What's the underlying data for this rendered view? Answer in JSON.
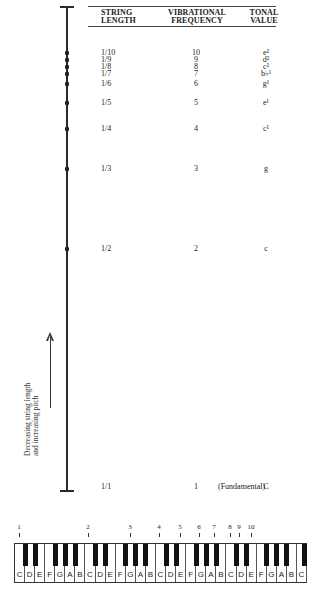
{
  "headers": {
    "string_length": [
      "STRING",
      "LENGTH"
    ],
    "vibrational_frequency": [
      "VIBRATIONAL",
      "FREQUENCY"
    ],
    "tonal_value": [
      "TONAL",
      "VALUE"
    ]
  },
  "rows": [
    {
      "length": "1/10",
      "frequency": "10",
      "tone": "e²",
      "y": 53
    },
    {
      "length": "1/9",
      "frequency": "9",
      "tone": "d²",
      "y": 60
    },
    {
      "length": "1/8",
      "frequency": "8",
      "tone": "c²",
      "y": 67
    },
    {
      "length": "1/7",
      "frequency": "7",
      "tone": "b♭¹",
      "y": 74
    },
    {
      "length": "1/6",
      "frequency": "6",
      "tone": "g¹",
      "y": 84
    },
    {
      "length": "1/5",
      "frequency": "5",
      "tone": "e¹",
      "y": 103
    },
    {
      "length": "1/4",
      "frequency": "4",
      "tone": "c¹",
      "y": 129
    },
    {
      "length": "1/3",
      "frequency": "3",
      "tone": "g",
      "y": 169
    },
    {
      "length": "1/2",
      "frequency": "2",
      "tone": "c",
      "y": 249
    },
    {
      "length": "1/1",
      "frequency": "1",
      "tone": "C",
      "y": 487,
      "note": "(Fundamental)"
    }
  ],
  "axis_label": [
    "Decreasing string length",
    "and increasing pitch"
  ],
  "harmonic_markers": [
    {
      "n": "1",
      "x": 19
    },
    {
      "n": "2",
      "x": 88
    },
    {
      "n": "3",
      "x": 130
    },
    {
      "n": "4",
      "x": 159
    },
    {
      "n": "5",
      "x": 180
    },
    {
      "n": "6",
      "x": 199
    },
    {
      "n": "7",
      "x": 214
    },
    {
      "n": "8",
      "x": 230
    },
    {
      "n": "9",
      "x": 239
    },
    {
      "n": "10",
      "x": 251
    }
  ],
  "keyboard": {
    "white_keys": [
      "C",
      "D",
      "E",
      "F",
      "G",
      "A",
      "B",
      "C",
      "D",
      "E",
      "F",
      "G",
      "A",
      "B",
      "C",
      "D",
      "E",
      "F",
      "G",
      "A",
      "B",
      "C",
      "D",
      "E",
      "F",
      "G",
      "A",
      "B",
      "C"
    ]
  }
}
